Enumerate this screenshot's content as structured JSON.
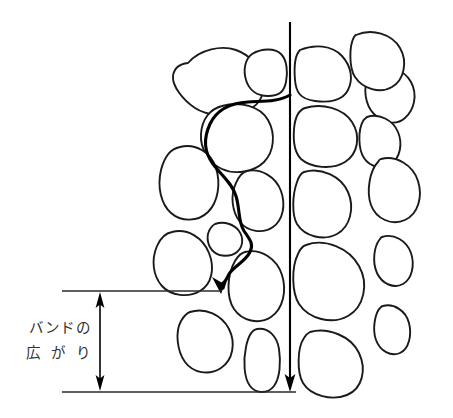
{
  "figure": {
    "domain": "diagram",
    "kind": "scientific-line-drawing",
    "background_color": "#ffffff",
    "ink_color": "#1a1a1a",
    "width": 453,
    "height": 418
  },
  "annotation": {
    "name": "band-broadening-label",
    "line1": "バンドの",
    "line2": "広 が り",
    "full_text": "バンドの広がり",
    "color": "#2f2f2f"
  },
  "measurement": {
    "name": "band-width-measure",
    "top_line_y": 291,
    "bottom_line_y": 392,
    "top_line_x_start": 62,
    "top_line_x_end": 222,
    "bottom_line_x_start": 62,
    "bottom_line_x_end": 296,
    "arrow_x": 100,
    "double_headed": true,
    "stroke_color": "#2a2a2a"
  },
  "paths": {
    "straight": {
      "name": "straight-flow-path",
      "label": "short direct route",
      "x": 290,
      "y_start": 22,
      "y_end": 390,
      "stroke_color": "#000000",
      "stroke_width": 2.1,
      "arrowhead": "down"
    },
    "tortuous": {
      "name": "tortuous-flow-path",
      "label": "long winding route around particles",
      "start_x": 290,
      "start_y": 95,
      "end_x": 222,
      "end_y": 292,
      "stroke_color": "#000000",
      "stroke_width": 3.1,
      "arrowhead": "down-left"
    }
  },
  "particles": {
    "name": "packing-particles",
    "count": 21,
    "fill": "#ffffff",
    "stroke": "#1a1a1a"
  }
}
